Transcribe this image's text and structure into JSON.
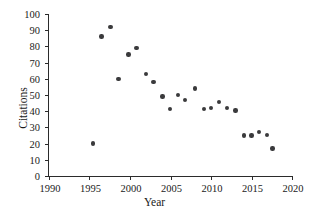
{
  "chart_data": {
    "type": "scatter",
    "title": "",
    "xlabel": "Year",
    "ylabel": "Citations",
    "xlim": [
      1990,
      2020
    ],
    "ylim": [
      0,
      100
    ],
    "xticks": [
      1990,
      1995,
      2000,
      2005,
      2010,
      2015,
      2020
    ],
    "yticks": [
      0,
      10,
      20,
      30,
      40,
      50,
      60,
      70,
      80,
      90,
      100
    ],
    "grid": false,
    "legend": null,
    "marker": {
      "shape": "circle",
      "color": "#3a3a3c",
      "size": 4.4
    },
    "series": [
      {
        "name": "Citations per year",
        "points": [
          {
            "x": 1995.4,
            "y": 20
          },
          {
            "x": 1996.5,
            "y": 86
          },
          {
            "x": 1997.6,
            "y": 92
          },
          {
            "x": 1998.6,
            "y": 60
          },
          {
            "x": 1999.8,
            "y": 75
          },
          {
            "x": 2000.8,
            "y": 79
          },
          {
            "x": 2002.0,
            "y": 63
          },
          {
            "x": 2002.9,
            "y": 58
          },
          {
            "x": 2004.0,
            "y": 49
          },
          {
            "x": 2004.9,
            "y": 41.5
          },
          {
            "x": 2005.9,
            "y": 50
          },
          {
            "x": 2006.8,
            "y": 47
          },
          {
            "x": 2008.0,
            "y": 54
          },
          {
            "x": 2009.1,
            "y": 41.5
          },
          {
            "x": 2010.0,
            "y": 42
          },
          {
            "x": 2011.0,
            "y": 45.5
          },
          {
            "x": 2012.0,
            "y": 42
          },
          {
            "x": 2013.0,
            "y": 40.5
          },
          {
            "x": 2014.1,
            "y": 25
          },
          {
            "x": 2015.0,
            "y": 25
          },
          {
            "x": 2015.9,
            "y": 27
          },
          {
            "x": 2016.9,
            "y": 25.5
          },
          {
            "x": 2017.6,
            "y": 17
          }
        ]
      }
    ]
  }
}
